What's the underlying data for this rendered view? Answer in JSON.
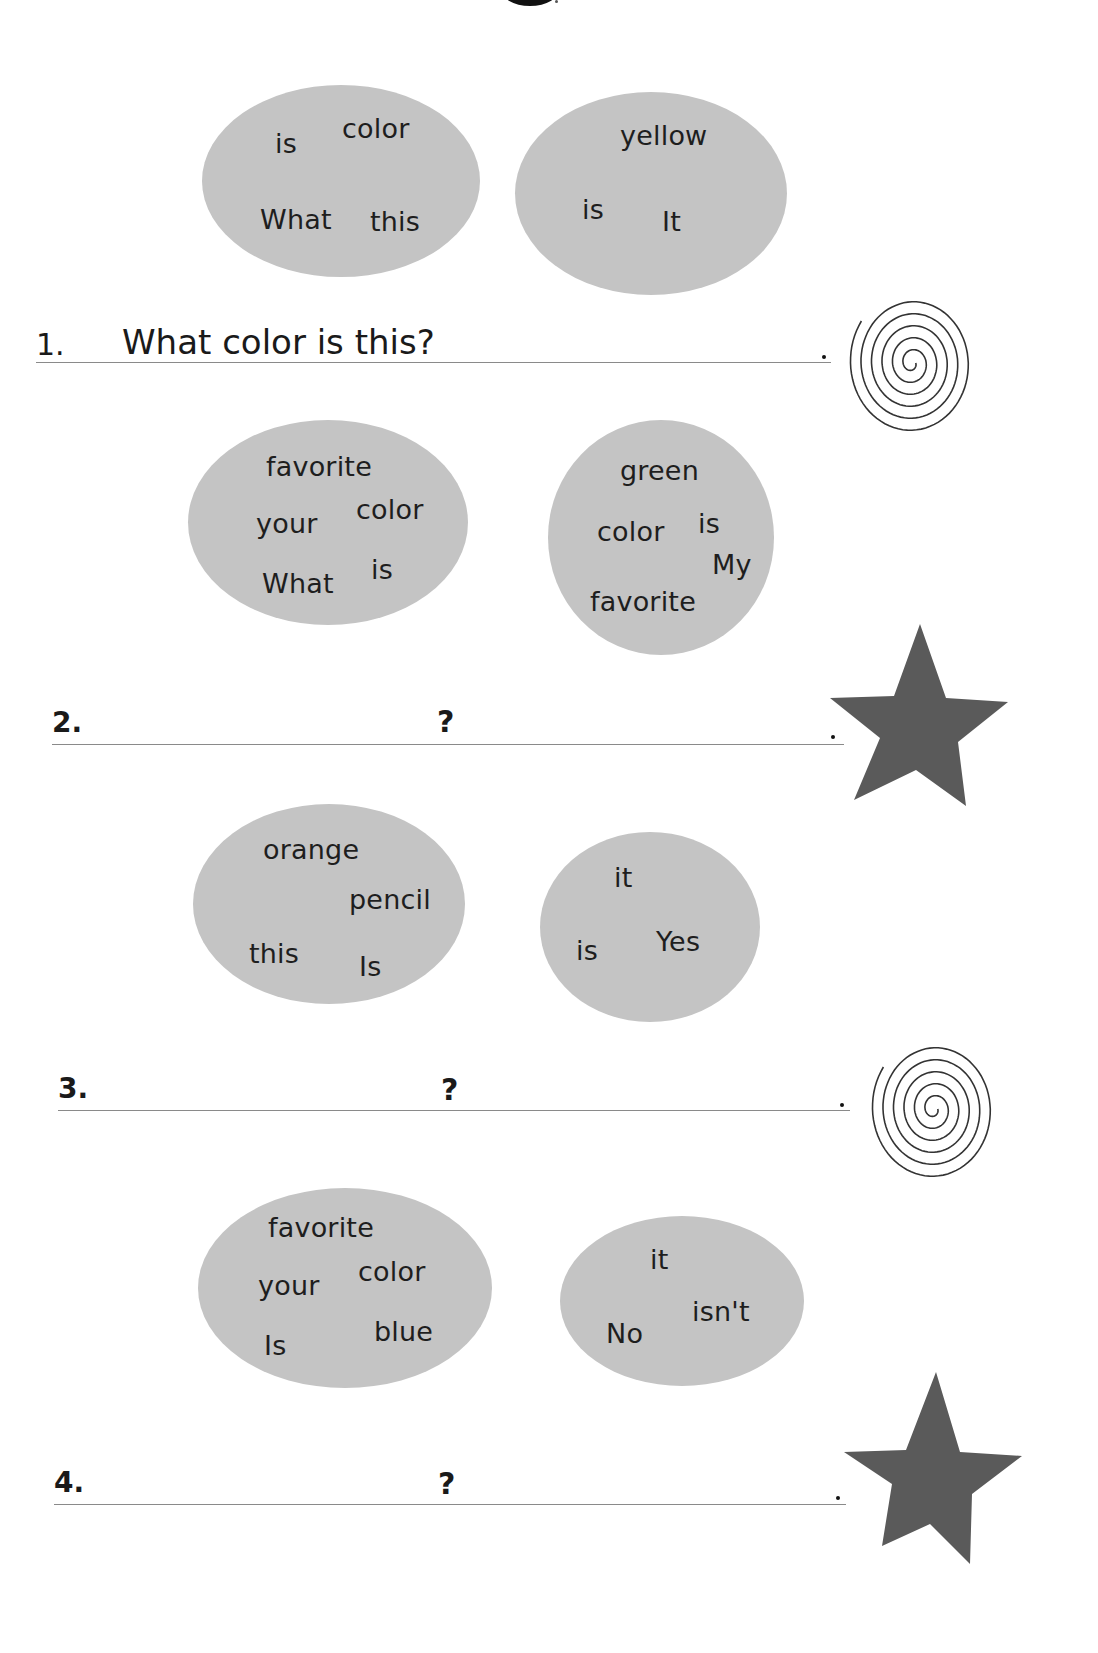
{
  "worksheet": {
    "instructions_hint": "Unscramble the words in the bubbles to write the question and answer.",
    "exercises": [
      {
        "number": "1.",
        "question_bubble": [
          "is",
          "color",
          "What",
          "this"
        ],
        "answer_bubble": [
          "yellow",
          "is",
          "It"
        ],
        "written_answer": "What color is this?",
        "question_mark": "",
        "period": ".",
        "decoration": "spiral-icon"
      },
      {
        "number": "2.",
        "question_bubble": [
          "favorite",
          "your",
          "color",
          "What",
          "is"
        ],
        "answer_bubble": [
          "green",
          "color",
          "is",
          "My",
          "favorite"
        ],
        "written_answer": "",
        "question_mark": "?",
        "period": ".",
        "decoration": "star-icon"
      },
      {
        "number": "3.",
        "question_bubble": [
          "orange",
          "pencil",
          "this",
          "Is"
        ],
        "answer_bubble": [
          "it",
          "is",
          "Yes"
        ],
        "written_answer": "",
        "question_mark": "?",
        "period": ".",
        "decoration": "spiral-icon"
      },
      {
        "number": "4.",
        "question_bubble": [
          "favorite",
          "your",
          "color",
          "Is",
          "blue"
        ],
        "answer_bubble": [
          "it",
          "isn't",
          "No"
        ],
        "written_answer": "",
        "question_mark": "?",
        "period": ".",
        "decoration": "star-icon"
      }
    ],
    "colors": {
      "bubble_fill": "#c4c4c4",
      "star_fill": "#5a5a5a",
      "spiral_stroke": "#333333",
      "rule_line": "#8a8a8a"
    }
  }
}
